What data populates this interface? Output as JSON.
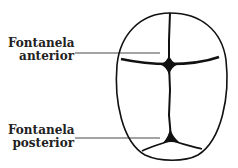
{
  "diagram": {
    "labels": [
      {
        "id": "anterior",
        "line1": "Fontanela",
        "line2": "anterior"
      },
      {
        "id": "posterior",
        "line1": "Fontanela",
        "line2": "posterior"
      }
    ],
    "colors": {
      "ink": "#111111",
      "background": "#ffffff"
    }
  }
}
